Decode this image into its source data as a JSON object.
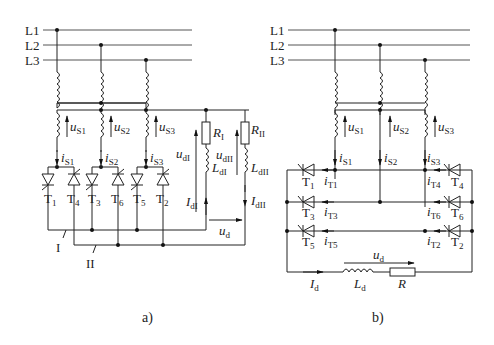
{
  "diagram": {
    "lines": [
      "L1",
      "L2",
      "L3"
    ],
    "panel_a": {
      "caption": "a)",
      "source_voltages": [
        {
          "v": "u",
          "s": "S1"
        },
        {
          "v": "u",
          "s": "S2"
        },
        {
          "v": "u",
          "s": "S3"
        }
      ],
      "source_currents": [
        {
          "v": "i",
          "s": "S1"
        },
        {
          "v": "i",
          "s": "S2"
        },
        {
          "v": "i",
          "s": "S3"
        }
      ],
      "thyristors": [
        {
          "v": "T",
          "s": "1"
        },
        {
          "v": "T",
          "s": "4"
        },
        {
          "v": "T",
          "s": "3"
        },
        {
          "v": "T",
          "s": "6"
        },
        {
          "v": "T",
          "s": "5"
        },
        {
          "v": "T",
          "s": "2"
        }
      ],
      "groups": [
        "I",
        "II"
      ],
      "load_I": {
        "R": "R",
        "R_sub": "I",
        "L": "L",
        "L_sub": "dI",
        "u": "u",
        "u_sub": "dI",
        "I": "I",
        "I_sub": "dI"
      },
      "load_II": {
        "R": "R",
        "R_sub": "II",
        "L": "L",
        "L_sub": "dII",
        "u": "u",
        "u_sub": "dII",
        "I": "I",
        "I_sub": "dII"
      },
      "output_voltage": {
        "v": "u",
        "s": "d"
      }
    },
    "panel_b": {
      "caption": "b)",
      "source_voltages": [
        {
          "v": "u",
          "s": "S1"
        },
        {
          "v": "u",
          "s": "S2"
        },
        {
          "v": "u",
          "s": "S3"
        }
      ],
      "source_currents": [
        {
          "v": "i",
          "s": "S1"
        },
        {
          "v": "i",
          "s": "S2"
        },
        {
          "v": "i",
          "s": "S3"
        }
      ],
      "left_thyristors": [
        {
          "v": "T",
          "s": "1"
        },
        {
          "v": "T",
          "s": "3"
        },
        {
          "v": "T",
          "s": "5"
        }
      ],
      "left_currents": [
        {
          "v": "i",
          "s": "T1"
        },
        {
          "v": "i",
          "s": "T3"
        },
        {
          "v": "i",
          "s": "T5"
        }
      ],
      "right_thyristors": [
        {
          "v": "T",
          "s": "4"
        },
        {
          "v": "T",
          "s": "6"
        },
        {
          "v": "T",
          "s": "2"
        }
      ],
      "right_currents": [
        {
          "v": "i",
          "s": "T4"
        },
        {
          "v": "i",
          "s": "T6"
        },
        {
          "v": "i",
          "s": "T2"
        }
      ],
      "load": {
        "I": "I",
        "I_sub": "d",
        "L": "L",
        "L_sub": "d",
        "R": "R",
        "u": "u",
        "u_sub": "d"
      }
    }
  }
}
